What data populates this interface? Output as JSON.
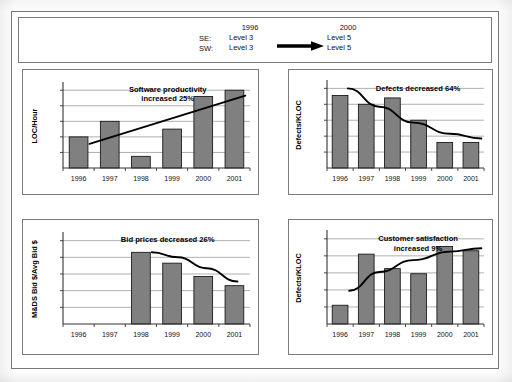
{
  "header": {
    "row_labels": [
      "SE:",
      "SW:"
    ],
    "col_before_year": "1996",
    "col_after_year": "2000",
    "before_levels": [
      "Level 3",
      "Level 3"
    ],
    "after_levels": [
      "Level 5",
      "Level 5"
    ],
    "arrow_icon": "right-arrow-icon"
  },
  "colors": {
    "bar_fill": "#808080",
    "bar_stroke": "#1a1a1a",
    "trend_line": "#000000",
    "grid": "#9a9a9a",
    "axis": "#333333",
    "panel_border": "#7b7b7b"
  },
  "chart_data": [
    {
      "id": "software-productivity",
      "type": "bar",
      "title": "Software productivity\nincreased 25%",
      "title_lines": [
        "Software productivity",
        "increased 25%"
      ],
      "xlabel": "",
      "ylabel": "LOC/Hour",
      "categories": [
        "1996",
        "1997",
        "1998",
        "1999",
        "2000",
        "2001"
      ],
      "values": [
        2.0,
        3.0,
        0.75,
        2.5,
        4.6,
        5.0
      ],
      "ylim": [
        0,
        5.4
      ],
      "gridlines": [
        1,
        2,
        3,
        4,
        5
      ],
      "grid": true,
      "legend": "none",
      "trend": {
        "type": "line",
        "label": "linear trend",
        "points": [
          [
            0.35,
            1.55
          ],
          [
            5.35,
            4.65
          ]
        ]
      }
    },
    {
      "id": "defects-decreased",
      "type": "bar",
      "title": "Defects decreased 64%",
      "title_lines": [
        "Defects decreased 64%"
      ],
      "xlabel": "",
      "ylabel": "Defects/KLOC",
      "categories": [
        "1996",
        "1997",
        "1998",
        "1999",
        "2000",
        "2001"
      ],
      "values": [
        4.55,
        4.0,
        4.4,
        3.0,
        1.6,
        1.6
      ],
      "ylim": [
        0,
        5.4
      ],
      "gridlines": [
        1,
        2,
        3,
        4,
        5
      ],
      "grid": true,
      "legend": "none",
      "trend": {
        "type": "curve",
        "label": "decreasing trend",
        "points": [
          [
            0.3,
            5.0
          ],
          [
            1.5,
            3.85
          ],
          [
            2.8,
            2.85
          ],
          [
            4.2,
            2.15
          ],
          [
            5.4,
            1.85
          ]
        ]
      }
    },
    {
      "id": "bid-prices",
      "type": "bar",
      "title": "Bid prices decreased  26%",
      "title_lines": [
        "Bid prices decreased  26%"
      ],
      "xlabel": "",
      "ylabel": "M&DS Bid $/Avg Bid $",
      "categories": [
        "1996",
        "1997",
        "1998",
        "1999",
        "2000",
        "2001"
      ],
      "values": [
        0,
        0,
        4.3,
        3.65,
        2.85,
        2.3
      ],
      "ylim": [
        0,
        5.4
      ],
      "gridlines": [
        1,
        2,
        3,
        4,
        5
      ],
      "grid": true,
      "legend": "none",
      "trend": {
        "type": "curve",
        "label": "decreasing trend",
        "points": [
          [
            2.35,
            4.3
          ],
          [
            3.2,
            4.0
          ],
          [
            4.1,
            3.35
          ],
          [
            5.1,
            2.55
          ]
        ]
      }
    },
    {
      "id": "customer-satisfaction",
      "type": "bar",
      "title": "Customer satisfaction\nincreased 9%",
      "title_lines": [
        "Customer satisfaction",
        "increased 9%"
      ],
      "xlabel": "",
      "ylabel": "Defects/KLOC",
      "categories": [
        "1996",
        "1997",
        "1998",
        "1999",
        "2000",
        "2001"
      ],
      "values": [
        1.1,
        4.1,
        3.25,
        2.95,
        4.55,
        4.3
      ],
      "ylim": [
        0,
        5.4
      ],
      "gridlines": [
        1,
        2,
        3,
        4,
        5
      ],
      "grid": true,
      "legend": "none",
      "trend": {
        "type": "curve",
        "label": "increasing trend",
        "points": [
          [
            0.35,
            1.95
          ],
          [
            1.5,
            3.05
          ],
          [
            2.8,
            3.75
          ],
          [
            4.2,
            4.25
          ],
          [
            5.4,
            4.45
          ]
        ]
      }
    }
  ]
}
